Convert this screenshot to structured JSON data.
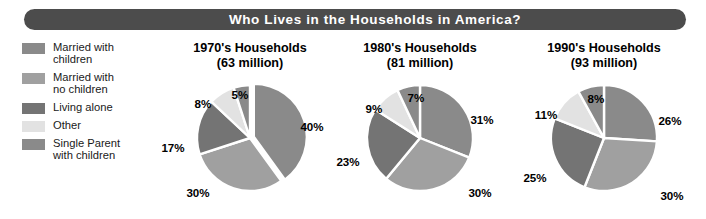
{
  "header": {
    "title": "Who Lives in the Households in America?",
    "bar_color": "#4c4c4c",
    "text_color": "#ffffff"
  },
  "legend": {
    "items": [
      {
        "label": "Married with\nchildren",
        "color": "#8a8a8a",
        "key": "married-with-children"
      },
      {
        "label": "Married with\nno children",
        "color": "#a0a0a0",
        "key": "married-no-children"
      },
      {
        "label": "Living alone",
        "color": "#747474",
        "key": "living-alone"
      },
      {
        "label": "Other",
        "color": "#e2e2e2",
        "key": "other"
      },
      {
        "label": "Single Parent\nwith children",
        "color": "#8a8a8a",
        "key": "single-parent-with-children"
      }
    ]
  },
  "chart_data": {
    "type": "pie",
    "title": "Who Lives in the Households in America?",
    "legend_position": "left",
    "categories": [
      "Married with children",
      "Married with no children",
      "Living alone",
      "Other",
      "Single Parent with children"
    ],
    "colors": [
      "#8a8a8a",
      "#a0a0a0",
      "#747474",
      "#e2e2e2",
      "#8a8a8a"
    ],
    "charts": [
      {
        "title": "1970's Households",
        "subtitle": "(63 million)",
        "decade": "1970's",
        "total_households": "63 million",
        "exploded": true,
        "values": [
          40,
          30,
          17,
          8,
          5
        ],
        "labels": [
          "40%",
          "30%",
          "17%",
          "8%",
          "5%"
        ],
        "label_points": [
          {
            "text": "40%",
            "x": 152,
            "y": 56
          },
          {
            "text": "30%",
            "x": 38,
            "y": 122
          },
          {
            "text": "17%",
            "x": 13,
            "y": 77
          },
          {
            "text": "8%",
            "x": 43,
            "y": 33
          },
          {
            "text": "5%",
            "x": 80,
            "y": 24
          }
        ]
      },
      {
        "title": "1980's Households",
        "subtitle": "(81 million)",
        "decade": "1980's",
        "total_households": "81 million",
        "exploded": false,
        "values": [
          31,
          30,
          23,
          9,
          7
        ],
        "labels": [
          "31%",
          "30%",
          "23%",
          "9%",
          "7%"
        ],
        "label_points": [
          {
            "text": "31%",
            "x": 152,
            "y": 49
          },
          {
            "text": "30%",
            "x": 150,
            "y": 122
          },
          {
            "text": "23%",
            "x": 18,
            "y": 91
          },
          {
            "text": "9%",
            "x": 44,
            "y": 38
          },
          {
            "text": "7%",
            "x": 86,
            "y": 27
          }
        ]
      },
      {
        "title": "1990's Households",
        "subtitle": "(93 million)",
        "decade": "1990's",
        "total_households": "93 million",
        "exploded": false,
        "values": [
          26,
          30,
          25,
          11,
          8
        ],
        "labels": [
          "26%",
          "30%",
          "25%",
          "11%",
          "8%"
        ],
        "label_points": [
          {
            "text": "26%",
            "x": 164,
            "y": 50
          },
          {
            "text": "30%",
            "x": 166,
            "y": 125
          },
          {
            "text": "25%",
            "x": 29,
            "y": 107
          },
          {
            "text": "11%",
            "x": 40,
            "y": 44
          },
          {
            "text": "8%",
            "x": 90,
            "y": 28
          }
        ]
      }
    ]
  }
}
